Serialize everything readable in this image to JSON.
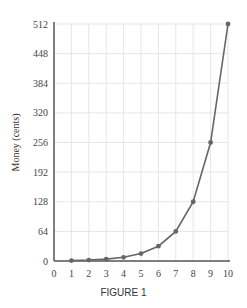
{
  "chart_data": {
    "type": "line",
    "title": "",
    "caption": "FIGURE 1",
    "xlabel": "",
    "ylabel": "Money (cents)",
    "x": [
      1,
      2,
      3,
      4,
      5,
      6,
      7,
      8,
      9,
      10
    ],
    "values": [
      1,
      2,
      4,
      8,
      16,
      32,
      64,
      128,
      256,
      512
    ],
    "xlim": [
      0,
      10
    ],
    "ylim": [
      0,
      512
    ],
    "xticks": [
      0,
      1,
      2,
      3,
      4,
      5,
      6,
      7,
      8,
      9,
      10
    ],
    "yticks": [
      0,
      64,
      128,
      192,
      256,
      320,
      384,
      448,
      512
    ],
    "grid": true,
    "line_color": "#666666",
    "marker": "circle"
  }
}
